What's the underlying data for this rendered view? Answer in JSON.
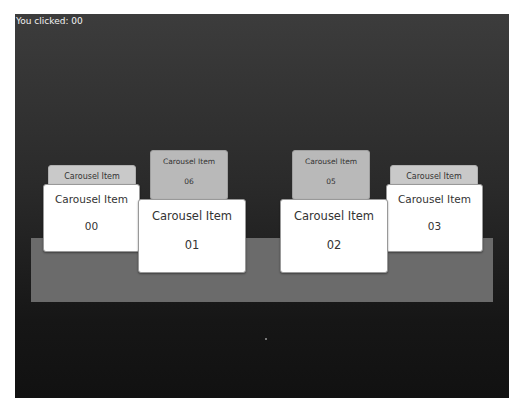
{
  "status": {
    "text": "You clicked: 00"
  },
  "colors": {
    "stage_top": "#3c3c3c",
    "stage_bottom": "#111111",
    "platform": "#6b6b6b",
    "card_front": "#ffffff",
    "card_back": "#b9b9b9"
  },
  "carousel": {
    "items": [
      {
        "title": "Carousel Item",
        "number": "00"
      },
      {
        "title": "Carousel Item",
        "number": "01"
      },
      {
        "title": "Carousel Item",
        "number": "02"
      },
      {
        "title": "Carousel Item",
        "number": "03"
      },
      {
        "title": "Carousel Item",
        "number": "04"
      },
      {
        "title": "Carousel Item",
        "number": "05"
      },
      {
        "title": "Carousel Item",
        "number": "06"
      },
      {
        "title": "Carousel Item",
        "number": "07"
      }
    ]
  }
}
